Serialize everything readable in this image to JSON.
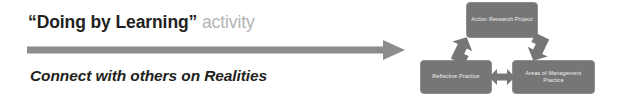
{
  "slide": {
    "background_color": "#ffffff",
    "left_panel": {
      "headline": {
        "quoted_part": "“Doing by Learning”",
        "plain_part": " activity",
        "quoted_color": "#231f20",
        "plain_color": "#b3b3b3"
      },
      "arrow": {
        "name": "progression-arrow",
        "direction": "right",
        "color": "#8c8c8c"
      },
      "subline": {
        "text": "Connect with others on Realities",
        "color": "#231f20",
        "style": "bold-italic"
      }
    },
    "diagram": {
      "name": "action-research-cycle",
      "node_fill": "#767676",
      "node_text_color": "#f2f2f2",
      "connector_color": "#767676",
      "nodes": [
        {
          "id": "top",
          "label": "Action Research Project"
        },
        {
          "id": "left",
          "label": "Reflective Practice"
        },
        {
          "id": "right",
          "label": "Areas of Management Practice"
        }
      ],
      "connectors": [
        {
          "id": "left-up",
          "from": "left",
          "to": "top",
          "type": "elbow-arrow"
        },
        {
          "id": "right-up",
          "from": "top",
          "to": "right",
          "type": "elbow-arrow"
        },
        {
          "id": "horizontal",
          "from": "left",
          "to": "right",
          "type": "double-arrow"
        }
      ]
    }
  }
}
